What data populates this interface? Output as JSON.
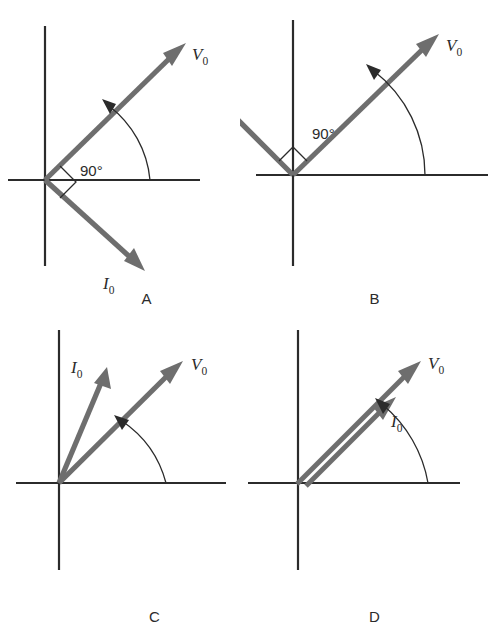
{
  "figure": {
    "top_cut_text": "",
    "background_color": "#ffffff",
    "axis_color": "#2b2b2b",
    "vector_color": "#6e6e6e",
    "arc_color": "#2b2b2b",
    "text_color": "#2b2b2b"
  },
  "labels": {
    "voltage_symbol": "V",
    "current_symbol": "I",
    "subscript": "0",
    "angle_90": "90°"
  },
  "panels": [
    {
      "id": "A",
      "letter": "A",
      "caption": "A",
      "angle_annotation": "90°",
      "has_right_angle_marker": true,
      "has_phase_arc": true,
      "vectors": [
        {
          "name": "V0",
          "symbol": "V",
          "sub": "0",
          "angle_deg": 45,
          "length": 170,
          "label_position": "upper-right"
        },
        {
          "name": "I0",
          "symbol": "I",
          "sub": "0",
          "angle_deg": -45,
          "length": 115,
          "label_position": "lower-right"
        }
      ]
    },
    {
      "id": "B",
      "letter": "B",
      "caption": "B",
      "angle_annotation": "90°",
      "has_right_angle_marker": true,
      "has_phase_arc": true,
      "vectors": [
        {
          "name": "V0",
          "symbol": "V",
          "sub": "0",
          "angle_deg": 45,
          "length": 170,
          "label_position": "upper-right"
        },
        {
          "name": "I0",
          "symbol": "I",
          "sub": "0",
          "angle_deg": 135,
          "length": 155,
          "label_position": "upper-left"
        }
      ]
    },
    {
      "id": "C",
      "letter": "C",
      "caption": "C",
      "angle_annotation": "",
      "has_right_angle_marker": false,
      "has_phase_arc": true,
      "vectors": [
        {
          "name": "V0",
          "symbol": "V",
          "sub": "0",
          "angle_deg": 45,
          "length": 160,
          "label_position": "upper-right"
        },
        {
          "name": "I0",
          "symbol": "I",
          "sub": "0",
          "angle_deg": 72,
          "length": 132,
          "label_position": "upper-left"
        }
      ]
    },
    {
      "id": "D",
      "letter": "D",
      "caption": "D",
      "angle_annotation": "",
      "has_right_angle_marker": false,
      "has_phase_arc": true,
      "vectors": [
        {
          "name": "V0",
          "symbol": "V",
          "sub": "0",
          "angle_deg": 45,
          "length": 165,
          "label_position": "upper-right"
        },
        {
          "name": "I0",
          "symbol": "I",
          "sub": "0",
          "angle_deg": 45,
          "length": 120,
          "label_position": "below-right",
          "offset": true
        }
      ]
    }
  ]
}
